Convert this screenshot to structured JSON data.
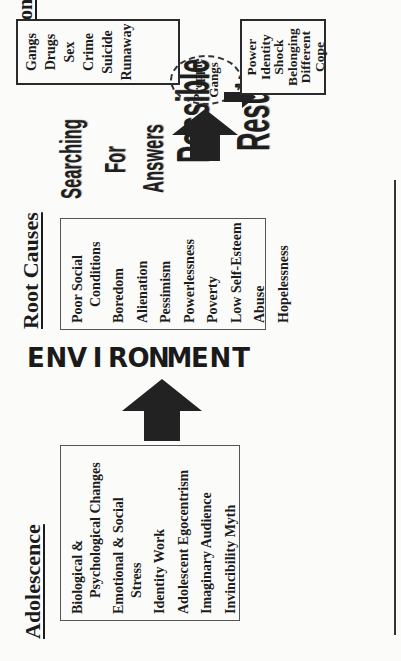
{
  "diagram": {
    "orientation": "rotated-90-ccw",
    "columns": [
      {
        "heading": "Adolescence",
        "items": [
          {
            "text": "Biological &",
            "indent": false
          },
          {
            "text": "Psychological Changes",
            "indent": true
          },
          {
            "text": "Emotional & Social",
            "indent": false
          },
          {
            "text": "Stress",
            "indent": true
          },
          {
            "text": "Identity Work",
            "indent": false
          },
          {
            "text": "Adolescent Egocentrism",
            "indent": false
          },
          {
            "text": "Imaginary Audience",
            "indent": false
          },
          {
            "text": "Invincibility Myth",
            "indent": false
          }
        ]
      },
      {
        "connector_label": "ENVIRONMENT",
        "connector_letters": [
          "E",
          "N",
          "V",
          "I",
          "R",
          "O",
          "N",
          "M",
          "E",
          "N",
          "T"
        ]
      },
      {
        "heading": "Root Causes",
        "items": [
          {
            "text": "Poor Social",
            "indent": false
          },
          {
            "text": "Conditions",
            "indent": true
          },
          {
            "text": "Boredom",
            "indent": false
          },
          {
            "text": "Alienation",
            "indent": false
          },
          {
            "text": "Pessimism",
            "indent": false
          },
          {
            "text": "Powerlessness",
            "indent": false
          },
          {
            "text": "Poverty",
            "indent": false
          },
          {
            "text": "Low Self-Esteem",
            "indent": false
          },
          {
            "text": "Abuse",
            "indent": false
          },
          {
            "text": "Hopelessness",
            "indent": false
          }
        ]
      },
      {
        "label_searching": [
          "Searching",
          "For",
          "Answers"
        ],
        "label_possible": [
          "Possible",
          "Results"
        ]
      },
      {
        "heading": "Options",
        "items": [
          "Gangs",
          "Drugs",
          "Sex",
          "Crime",
          "Suicide",
          "Runaway"
        ],
        "highlight": [
          "Preppie",
          "Gangs"
        ],
        "results": [
          "Power",
          "Identity",
          "Shock",
          "Belonging",
          "Different",
          "Cope"
        ]
      }
    ],
    "colors": {
      "background": "#fbfbfa",
      "ink": "#1c1c1c",
      "box_border": "#555555",
      "arrow": "#222222"
    }
  }
}
